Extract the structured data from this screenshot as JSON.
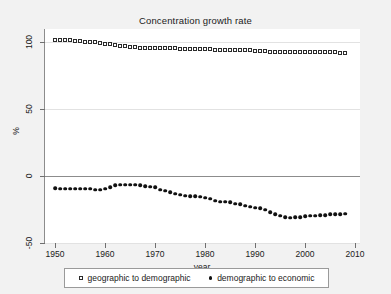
{
  "chart_data": {
    "type": "scatter",
    "title": "Concentration growth rate",
    "xlabel": "year",
    "ylabel": "%",
    "xlim": [
      1948,
      2011
    ],
    "ylim": [
      -50,
      110
    ],
    "xticks": [
      1950,
      1960,
      1970,
      1980,
      1990,
      2000,
      2010
    ],
    "yticks": [
      -50,
      0,
      50,
      100
    ],
    "grid": true,
    "legend_position": "bottom",
    "x": [
      1950,
      1951,
      1952,
      1953,
      1954,
      1955,
      1956,
      1957,
      1958,
      1959,
      1960,
      1961,
      1962,
      1963,
      1964,
      1965,
      1966,
      1967,
      1968,
      1969,
      1970,
      1971,
      1972,
      1973,
      1974,
      1975,
      1976,
      1977,
      1978,
      1979,
      1980,
      1981,
      1982,
      1983,
      1984,
      1985,
      1986,
      1987,
      1988,
      1989,
      1990,
      1991,
      1992,
      1993,
      1994,
      1995,
      1996,
      1997,
      1998,
      1999,
      2000,
      2001,
      2002,
      2003,
      2004,
      2005,
      2006,
      2007,
      2008
    ],
    "series": [
      {
        "name": "geographic to demographic",
        "marker": "hollow-square",
        "values": [
          102,
          102,
          102,
          101.5,
          101,
          101,
          100.5,
          100,
          100,
          99.5,
          99,
          98.5,
          98,
          97.5,
          97,
          96.5,
          96.5,
          96,
          96,
          96,
          95.5,
          95.5,
          95.5,
          95.5,
          95.5,
          95,
          95,
          95,
          95,
          95,
          95,
          95,
          94.5,
          94.5,
          94.5,
          94.5,
          94,
          94,
          94,
          94,
          93.5,
          93.5,
          93.5,
          93,
          93,
          93,
          93,
          93,
          93,
          93,
          93,
          92.5,
          92.5,
          92.5,
          92.5,
          92.5,
          92.5,
          92,
          92
        ]
      },
      {
        "name": "demographic to economic",
        "marker": "filled-circle",
        "values": [
          -9,
          -9.5,
          -9.5,
          -9.5,
          -9.5,
          -9.5,
          -9.5,
          -9.5,
          -10,
          -10,
          -9.5,
          -8.5,
          -7,
          -6.5,
          -6.5,
          -6.5,
          -6.5,
          -7,
          -7.5,
          -8,
          -8.5,
          -10,
          -11,
          -12,
          -13,
          -14,
          -14.5,
          -15,
          -15,
          -15.5,
          -16,
          -17,
          -18.5,
          -19,
          -19,
          -19.5,
          -20.5,
          -21,
          -22,
          -23,
          -23.5,
          -24,
          -25,
          -27,
          -28.5,
          -29.5,
          -30.5,
          -31,
          -30.5,
          -30.5,
          -30,
          -29.5,
          -29.5,
          -29,
          -29,
          -28.5,
          -28.5,
          -28.5,
          -28
        ]
      }
    ]
  },
  "legend": {
    "items": [
      {
        "label": "geographic to demographic",
        "marker": "hollow-square"
      },
      {
        "label": "demographic to economic",
        "marker": "filled-circle"
      }
    ]
  }
}
